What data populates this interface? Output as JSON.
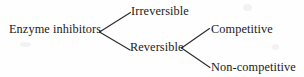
{
  "diagram": {
    "type": "tree",
    "text_color": "#1a1a1a",
    "background_color": "#fefefe",
    "nodes": {
      "root": {
        "label": "Enzyme inhibitors",
        "level": 0
      },
      "irreversible": {
        "label": "Irreversible",
        "level": 1
      },
      "reversible": {
        "label": "Reversible",
        "level": 1
      },
      "competitive": {
        "label": "Competitive",
        "level": 2
      },
      "non_competitive": {
        "label": "Non-competitive",
        "level": 2
      }
    },
    "branches": [
      {
        "from": "root",
        "to": "irreversible"
      },
      {
        "from": "root",
        "to": "reversible"
      },
      {
        "from": "reversible",
        "to": "competitive"
      },
      {
        "from": "reversible",
        "to": "non_competitive"
      }
    ]
  }
}
